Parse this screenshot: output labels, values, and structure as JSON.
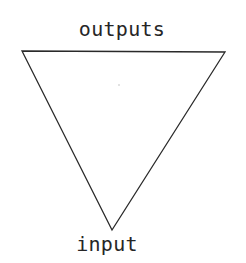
{
  "figure": {
    "kind": "downward-pointing-triangle-diagram",
    "canvas": {
      "width": 246,
      "height": 263
    },
    "background_color": "#ffffff",
    "stroke_color": "#2a2a2a",
    "text_color": "#262626",
    "labels": {
      "top": "outputs",
      "bottom": "input"
    },
    "triangle": {
      "orientation": "apex-down",
      "filled": false,
      "stroke_width": 1.3,
      "vertices": [
        {
          "name": "top-left",
          "x": 22,
          "y": 51
        },
        {
          "name": "top-right",
          "x": 225,
          "y": 52
        },
        {
          "name": "bottom-apex",
          "x": 112,
          "y": 230
        }
      ]
    },
    "artifacts": [
      {
        "name": "scan-speck",
        "x": 118,
        "y": 84
      }
    ]
  }
}
